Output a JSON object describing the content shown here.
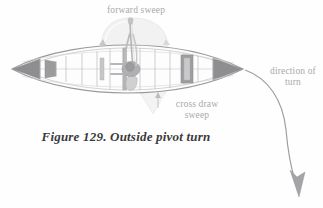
{
  "figure": {
    "caption": "Figure 129.  Outside pivot turn",
    "caption_number": "129",
    "caption_title": "Outside pivot turn",
    "background_color": "#fefefe"
  },
  "labels": {
    "forward_sweep": "forward sweep",
    "cross_draw_sweep": "cross draw\nsweep",
    "cross_draw_sweep_line1": "cross draw",
    "cross_draw_sweep_line2": "sweep",
    "direction_of_turn": "direction of\nturn",
    "direction_of_turn_line1": "direction of",
    "direction_of_turn_line2": "turn",
    "label_color": "#a9a9ab",
    "caption_color": "#3a3a3c"
  },
  "diagram": {
    "type": "canoe-top-view-technical-illustration",
    "view": "top-down plan view",
    "parts": [
      {
        "name": "hull-outline",
        "color": "#9a9a9c"
      },
      {
        "name": "bow-deck",
        "color": "#8e8e90"
      },
      {
        "name": "stern-deck",
        "color": "#8e8e90"
      },
      {
        "name": "thwart",
        "color": "#b5b5b7"
      },
      {
        "name": "seat",
        "color": "#a0a0a2"
      },
      {
        "name": "centerline",
        "color": "#c8c8ca"
      },
      {
        "name": "paddler-figure",
        "color": "#a8a8aa"
      },
      {
        "name": "paddle",
        "color": "#b0b0b2"
      },
      {
        "name": "forward-sweep-arc",
        "color": "#e2e2e4"
      },
      {
        "name": "cross-draw-sweep-wedge",
        "color": "#eaeaec"
      },
      {
        "name": "direction-of-turn-arrow",
        "color": "#9e9ea0"
      }
    ],
    "stroke_colors": {
      "hull": "#9a9a9c",
      "deck_fill": "#8e8e90",
      "light_fill": "#efeff0",
      "arrow": "#9e9ea0",
      "sweep_arc": "#e4e4e6"
    },
    "canoe_geometry": {
      "bow_tip_x": 12,
      "stern_tip_x": 243,
      "centerline_y": 69,
      "max_beam_half_height": 22
    }
  }
}
